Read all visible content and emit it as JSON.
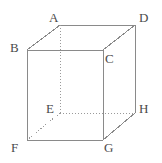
{
  "figure": {
    "width": 162,
    "height": 163,
    "background_color": "#ffffff",
    "edge_color": "#8a8a8a",
    "hidden_edge_color": "#9a9a9a",
    "label_color": "#4a4a4a",
    "edge_stroke_width": 1,
    "hidden_edge_dash": "1,2"
  },
  "vertices": [
    {
      "id": "A",
      "label": "A",
      "x": 60,
      "y": 25,
      "label_x": 49,
      "label_y": 11,
      "hidden": false
    },
    {
      "id": "B",
      "label": "B",
      "x": 27,
      "y": 50,
      "label_x": 10,
      "label_y": 41,
      "hidden": false
    },
    {
      "id": "C",
      "label": "C",
      "x": 103,
      "y": 50,
      "label_x": 105,
      "label_y": 52,
      "hidden": false
    },
    {
      "id": "D",
      "label": "D",
      "x": 135,
      "y": 25,
      "label_x": 139,
      "label_y": 11,
      "hidden": false
    },
    {
      "id": "E",
      "label": "E",
      "x": 60,
      "y": 113,
      "label_x": 46,
      "label_y": 102,
      "hidden": true
    },
    {
      "id": "F",
      "label": "F",
      "x": 27,
      "y": 140,
      "label_x": 11,
      "label_y": 141,
      "hidden": false
    },
    {
      "id": "G",
      "label": "G",
      "x": 103,
      "y": 140,
      "label_x": 104,
      "label_y": 141,
      "hidden": false
    },
    {
      "id": "H",
      "label": "H",
      "x": 135,
      "y": 113,
      "label_x": 139,
      "label_y": 102,
      "hidden": false
    }
  ],
  "edges": [
    {
      "id": "A-D",
      "from": "A",
      "to": "D",
      "style": "solid"
    },
    {
      "id": "B-C",
      "from": "B",
      "to": "C",
      "style": "solid"
    },
    {
      "id": "B-A",
      "from": "B",
      "to": "A",
      "style": "solid"
    },
    {
      "id": "C-D",
      "from": "C",
      "to": "D",
      "style": "solid"
    },
    {
      "id": "B-F",
      "from": "B",
      "to": "F",
      "style": "solid"
    },
    {
      "id": "C-G",
      "from": "C",
      "to": "G",
      "style": "solid"
    },
    {
      "id": "D-H",
      "from": "D",
      "to": "H",
      "style": "solid"
    },
    {
      "id": "F-G",
      "from": "F",
      "to": "G",
      "style": "solid"
    },
    {
      "id": "G-H",
      "from": "G",
      "to": "H",
      "style": "solid"
    },
    {
      "id": "A-E",
      "from": "A",
      "to": "E",
      "style": "dotted"
    },
    {
      "id": "E-H",
      "from": "E",
      "to": "H",
      "style": "dotted"
    },
    {
      "id": "E-F",
      "from": "E",
      "to": "F",
      "style": "dotted"
    }
  ]
}
